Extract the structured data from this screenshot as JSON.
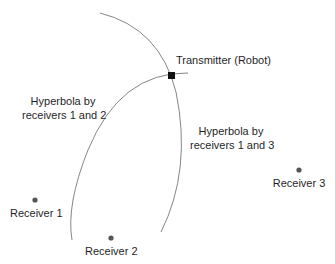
{
  "diagram": {
    "transmitter": {
      "label": "Transmitter (Robot)",
      "x": 172,
      "y": 76
    },
    "receivers": [
      {
        "label": "Receiver 1",
        "x": 35,
        "y": 200
      },
      {
        "label": "Receiver 2",
        "x": 111,
        "y": 238
      },
      {
        "label": "Receiver 3",
        "x": 299,
        "y": 170
      }
    ],
    "hyperbolas": [
      {
        "label_line1": "Hyperbola by",
        "label_line2": "receivers 1 and 2"
      },
      {
        "label_line1": "Hyperbola by",
        "label_line2": "receivers 1 and 3"
      }
    ],
    "colors": {
      "curve": "#777777",
      "dot": "#555555",
      "transmitter": "#111111"
    }
  }
}
